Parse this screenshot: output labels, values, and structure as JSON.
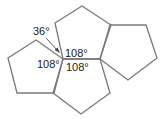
{
  "diagram": {
    "type": "pentagon-tiling",
    "stroke_color": "#7a7a7a",
    "pentagons": [
      {
        "name": "top",
        "points": "63,59 55,23 82,6 111,25 100,59"
      },
      {
        "name": "left",
        "points": "63,59 36,40 8,58 17,93 54,93"
      },
      {
        "name": "right",
        "points": "100,59 110,25 146,25 157,58 128,80"
      },
      {
        "name": "bottom",
        "points": "63,59 100,59 110,93 81,114 53,93"
      }
    ],
    "labels": {
      "gap_angle": "36°",
      "angle_top": "108°",
      "angle_left": "108°",
      "angle_bottom": "108°"
    }
  }
}
